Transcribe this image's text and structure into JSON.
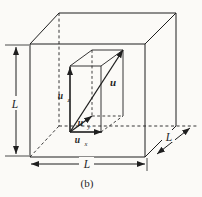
{
  "diagram": {
    "caption": "(b)",
    "dimensions": {
      "left_label": "L",
      "bottom_label": "L",
      "depth_label": "L"
    },
    "vectors": {
      "resultant_label": "u",
      "component_x": {
        "base": "u",
        "sub": "x"
      },
      "component_y": {
        "base": "u",
        "sub": "y"
      },
      "component_z": {
        "base": "u",
        "sub": "z"
      }
    },
    "colors": {
      "line": "#1f1f1f",
      "background": "#fbfaf7"
    }
  }
}
